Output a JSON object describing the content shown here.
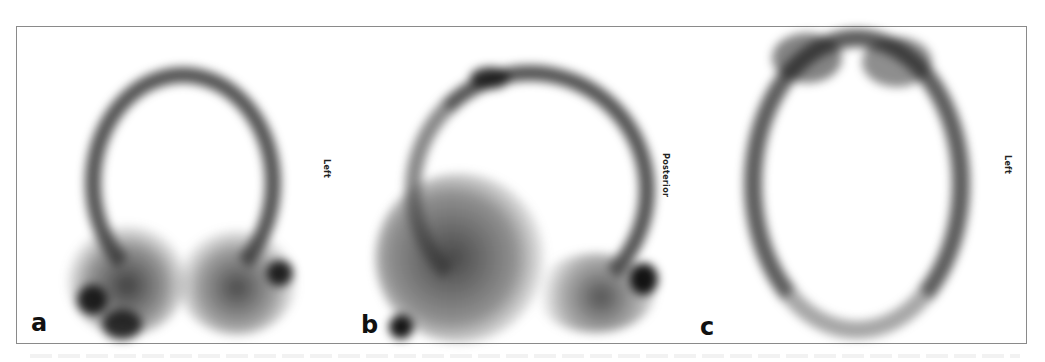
{
  "figure": {
    "panels": [
      {
        "id": "a",
        "letter": "a",
        "orientation_label": "Left",
        "view": "coronal"
      },
      {
        "id": "b",
        "letter": "b",
        "orientation_label": "Posterior",
        "view": "sagittal"
      },
      {
        "id": "c",
        "letter": "c",
        "orientation_label": "Left",
        "view": "transaxial"
      }
    ]
  },
  "colors": {
    "frame_border": "#8a8a8a",
    "uptake_dark": "#1e1e1e",
    "background": "#ffffff"
  }
}
